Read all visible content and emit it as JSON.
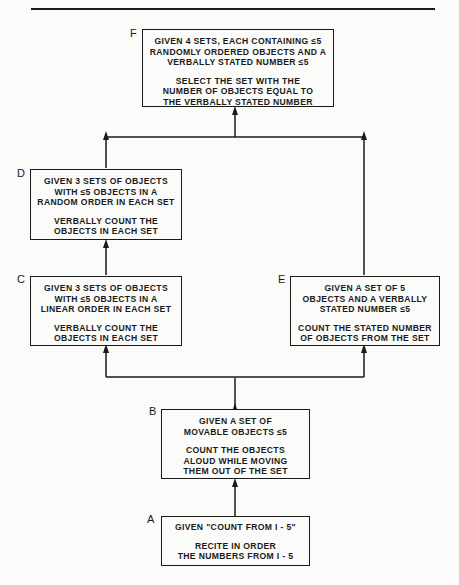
{
  "diagram": {
    "type": "learning-hierarchy",
    "nodes": [
      {
        "id": "F",
        "letter": "F",
        "given": [
          "GIVEN 4 SETS, EACH CONTAINING ≤5",
          "RANDOMLY ORDERED OBJECTS  AND  A",
          "VERBALLY STATED  NUMBER ≤5"
        ],
        "task": [
          "SELECT  THE  SET  WITH  THE",
          "NUMBER  OF  OBJECTS  EQUAL  TO",
          "THE  VERBALLY  STATED  NUMBER"
        ]
      },
      {
        "id": "D",
        "letter": "D",
        "given": [
          "GIVEN 3 SETS  OF OBJECTS",
          "WITH ≤5  OBJECTS  IN  A",
          "RANDOM  ORDER  IN  EACH  SET"
        ],
        "task": [
          "VERBALLY  COUNT  THE",
          "OBJECTS  IN  EACH  SET"
        ]
      },
      {
        "id": "C",
        "letter": "C",
        "given": [
          "GIVEN  3  SETS  OF  OBJECTS",
          "WITH  ≤5  OBJECTS  IN  A",
          "LINEAR  ORDER  IN  EACH  SET"
        ],
        "task": [
          "VERBALLY  COUNT  THE",
          "OBJECTS  IN  EACH  SET"
        ]
      },
      {
        "id": "E",
        "letter": "E",
        "given": [
          "GIVEN  A  SET  OF  5",
          "OBJECTS  AND  A  VERBALLY",
          "STATED  NUMBER  ≤5"
        ],
        "task": [
          "COUNT  THE  STATED  NUMBER",
          "OF  OBJECTS  FROM  THE  SET"
        ]
      },
      {
        "id": "B",
        "letter": "B",
        "given": [
          "GIVEN  A  SET  OF",
          "MOVABLE  OBJECTS  ≤5"
        ],
        "task": [
          "COUNT  THE  OBJECTS",
          "ALOUD  WHILE  MOVING",
          "THEM  OUT  OF  THE  SET"
        ]
      },
      {
        "id": "A",
        "letter": "A",
        "given": [
          "GIVEN  \"COUNT  FROM  I - 5\""
        ],
        "task": [
          "RECITE  IN  ORDER",
          "THE  NUMBERS  FROM  I - 5"
        ]
      }
    ],
    "edges": [
      {
        "from": "A",
        "to": "B"
      },
      {
        "from": "B",
        "to": "C"
      },
      {
        "from": "B",
        "to": "E"
      },
      {
        "from": "C",
        "to": "D"
      },
      {
        "from": "D",
        "to": "F"
      },
      {
        "from": "E",
        "to": "F"
      }
    ],
    "colors": {
      "ink": "#1a1a1a",
      "paper": "#fbfbf9"
    }
  }
}
